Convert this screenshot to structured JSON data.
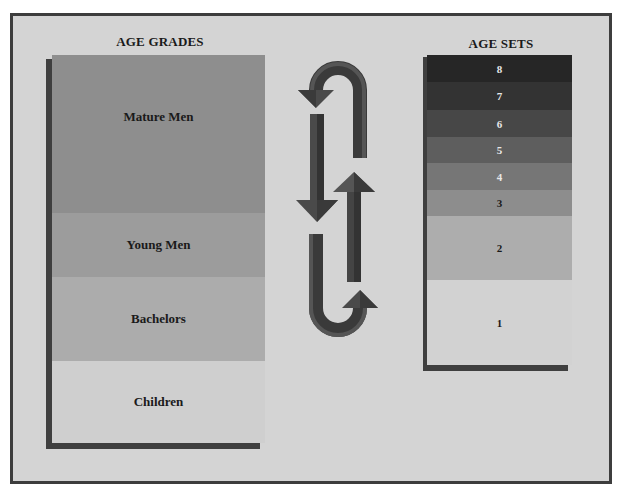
{
  "diagram": {
    "left_column": {
      "title": "AGE GRADES",
      "bands": [
        {
          "label": "Mature Men",
          "color": "#8e8e8e"
        },
        {
          "label": "Young Men",
          "color": "#9c9c9c"
        },
        {
          "label": "Bachelors",
          "color": "#acacac"
        },
        {
          "label": "Children",
          "color": "#cfcfcf"
        }
      ]
    },
    "right_column": {
      "title": "AGE SETS",
      "bands": [
        {
          "label": "8",
          "color": "#262626"
        },
        {
          "label": "7",
          "color": "#333333"
        },
        {
          "label": "6",
          "color": "#474747"
        },
        {
          "label": "5",
          "color": "#5e5e5e"
        },
        {
          "label": "4",
          "color": "#767676"
        },
        {
          "label": "3",
          "color": "#8d8d8d"
        },
        {
          "label": "2",
          "color": "#adadad"
        },
        {
          "label": "1",
          "color": "#d2d2d2"
        }
      ]
    },
    "center": {
      "description": "cycle-arrows",
      "arrow_color": "#4a4a4a",
      "arrow_highlight": "#6a6a6a"
    },
    "colors": {
      "background": "#d4d4d4",
      "border": "#3d3d3d"
    }
  }
}
